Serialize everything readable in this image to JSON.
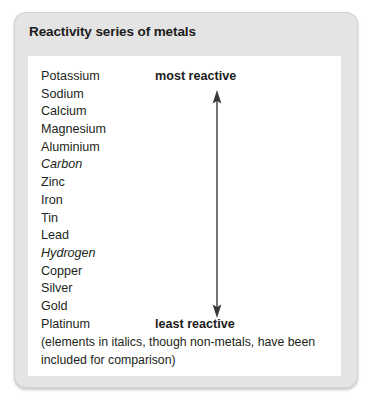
{
  "figure": {
    "title": "Reactivity series of metals",
    "panel": {
      "series": [
        {
          "name": "Potassium",
          "italic": false
        },
        {
          "name": "Sodium",
          "italic": false
        },
        {
          "name": "Calcium",
          "italic": false
        },
        {
          "name": "Magnesium",
          "italic": false
        },
        {
          "name": "Aluminium",
          "italic": false
        },
        {
          "name": "Carbon",
          "italic": true
        },
        {
          "name": "Zinc",
          "italic": false
        },
        {
          "name": "Iron",
          "italic": false
        },
        {
          "name": "Tin",
          "italic": false
        },
        {
          "name": "Lead",
          "italic": false
        },
        {
          "name": "Hydrogen",
          "italic": true
        },
        {
          "name": "Copper",
          "italic": false
        },
        {
          "name": "Silver",
          "italic": false
        },
        {
          "name": "Gold",
          "italic": false
        },
        {
          "name": "Platinum",
          "italic": false
        }
      ],
      "top_label": "most reactive",
      "bottom_label": "least reactive",
      "arrow": "double-headed-vertical-arrow",
      "footnote": "(elements in italics, though non-metals, have been included for comparison)"
    },
    "colors": {
      "card_background": "#e4e4e4",
      "panel_background": "#ffffff",
      "text": "#231f20",
      "title_text": "#1c1c1c",
      "arrow": "#3a3a3a"
    }
  }
}
